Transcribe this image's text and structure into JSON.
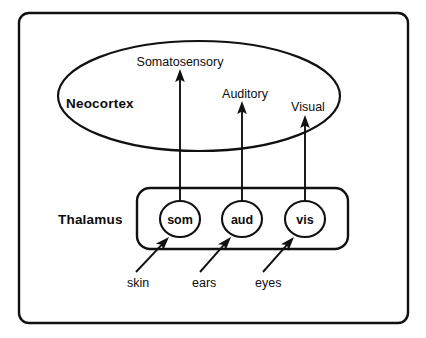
{
  "figure": {
    "background_color": "#ffffff",
    "line_color": "#111111",
    "text_color": "#0d0d0d"
  },
  "frame": {
    "name": "outer-frame",
    "x": 19,
    "y": 13,
    "width": 389,
    "height": 310,
    "corner_radius": 10
  },
  "neocortex": {
    "label": "Neocortex",
    "shape": "ellipse",
    "cx": 199,
    "cy": 96,
    "rx": 141,
    "ry": 55,
    "label_x": 66,
    "label_y": 108,
    "areas": [
      {
        "id": "somatosensory",
        "label": "Somatosensory",
        "label_x": 135,
        "label_y": 66,
        "arrow_x": 180,
        "arrow_tip_y": 71
      },
      {
        "id": "auditory",
        "label": "Auditory",
        "label_x": 215,
        "label_y": 98,
        "arrow_x": 242,
        "arrow_tip_y": 103
      },
      {
        "id": "visual",
        "label": "Visual",
        "label_x": 286,
        "label_y": 111,
        "arrow_x": 305,
        "arrow_tip_y": 117
      }
    ]
  },
  "thalamus": {
    "label": "Thalamus",
    "label_x": 58,
    "label_y": 224,
    "box": {
      "x": 137,
      "y": 188,
      "width": 211,
      "height": 61,
      "corner_radius": 13
    },
    "nuclei": [
      {
        "id": "som",
        "label": "som",
        "cx": 180,
        "cy": 219,
        "rx": 20,
        "ry": 18
      },
      {
        "id": "aud",
        "label": "aud",
        "cx": 242,
        "cy": 219,
        "rx": 20,
        "ry": 18
      },
      {
        "id": "vis",
        "label": "vis",
        "cx": 305,
        "cy": 219,
        "rx": 20,
        "ry": 18
      }
    ]
  },
  "sensory_inputs": [
    {
      "id": "skin",
      "label": "skin",
      "label_x": 127,
      "label_y": 287,
      "arrow_from_x": 136,
      "arrow_from_y": 272,
      "arrow_to_x": 169,
      "arrow_to_y": 237
    },
    {
      "id": "ears",
      "label": "ears",
      "label_x": 192,
      "label_y": 287,
      "arrow_from_x": 200,
      "arrow_from_y": 272,
      "arrow_to_x": 231,
      "arrow_to_y": 237
    },
    {
      "id": "eyes",
      "label": "eyes",
      "label_x": 255,
      "label_y": 287,
      "arrow_from_x": 263,
      "arrow_from_y": 272,
      "arrow_to_x": 294,
      "arrow_to_y": 237
    }
  ],
  "projections": [
    {
      "id": "som-to-somatosensory",
      "from": "som",
      "to": "somatosensory",
      "x": 180,
      "y_start": 201,
      "y_end": 71
    },
    {
      "id": "aud-to-auditory",
      "from": "aud",
      "to": "auditory",
      "x": 242,
      "y_start": 201,
      "y_end": 103
    },
    {
      "id": "vis-to-visual",
      "from": "vis",
      "to": "visual",
      "x": 305,
      "y_start": 201,
      "y_end": 117
    }
  ]
}
